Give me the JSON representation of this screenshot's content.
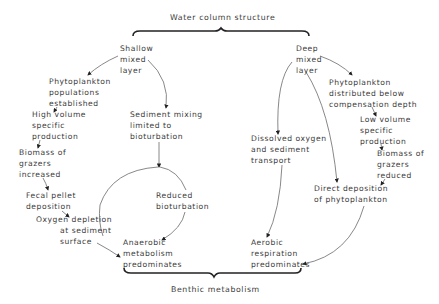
{
  "diagram": {
    "top_title": "Water column structure",
    "bottom_title": "Benthic metabolism",
    "line_color": "#555555",
    "text_color": "#3a3a3a",
    "nodes": {
      "shallow": [
        "Shallow",
        "mixed",
        "layer"
      ],
      "deep": [
        "Deep",
        "mixed",
        "layer"
      ],
      "phyto_established": [
        "Phytoplankton",
        "populations",
        "established"
      ],
      "high_volume": [
        "High volume",
        "specific",
        "production"
      ],
      "grazers_increased": [
        "Biomass of",
        "grazers",
        "increased"
      ],
      "fecal": [
        "Fecal pellet",
        "deposition"
      ],
      "oxygen_depletion": [
        "Oxygen depletion",
        "at sediment",
        "surface"
      ],
      "sediment_mixing": [
        "Sediment mixing",
        "limited to",
        "bioturbation"
      ],
      "reduced_bioturbation": [
        "Reduced",
        "bioturbation"
      ],
      "anaerobic": [
        "Anaerobic",
        "metabolism",
        "predominates"
      ],
      "phyto_distributed": [
        "Phytoplankton",
        "distributed below",
        "compensation depth"
      ],
      "low_volume": [
        "Low volume",
        "specific",
        "production"
      ],
      "dissolved_oxygen": [
        "Dissolved oxygen",
        "and sediment",
        "transport"
      ],
      "grazers_reduced": [
        "Biomass of",
        "grazers",
        "reduced"
      ],
      "direct_deposition": [
        "Direct deposition",
        "of phytoplankton"
      ],
      "aerobic": [
        "Aerobic",
        "respiration",
        "predominates"
      ]
    },
    "edges": [
      [
        "shallow",
        "phyto_established"
      ],
      [
        "shallow",
        "sediment_mixing"
      ],
      [
        "phyto_established",
        "high_volume"
      ],
      [
        "high_volume",
        "grazers_increased"
      ],
      [
        "grazers_increased",
        "fecal"
      ],
      [
        "fecal",
        "oxygen_depletion"
      ],
      [
        "oxygen_depletion",
        "anaerobic"
      ],
      [
        "sediment_mixing",
        "reduced_bioturbation"
      ],
      [
        "reduced_bioturbation",
        "anaerobic"
      ],
      [
        "anaerobic",
        "reduced_bioturbation"
      ],
      [
        "deep",
        "phyto_distributed"
      ],
      [
        "deep",
        "dissolved_oxygen"
      ],
      [
        "deep",
        "direct_deposition"
      ],
      [
        "phyto_distributed",
        "low_volume"
      ],
      [
        "low_volume",
        "grazers_reduced"
      ],
      [
        "grazers_reduced",
        "direct_deposition"
      ],
      [
        "dissolved_oxygen",
        "aerobic"
      ],
      [
        "direct_deposition",
        "aerobic"
      ]
    ]
  }
}
